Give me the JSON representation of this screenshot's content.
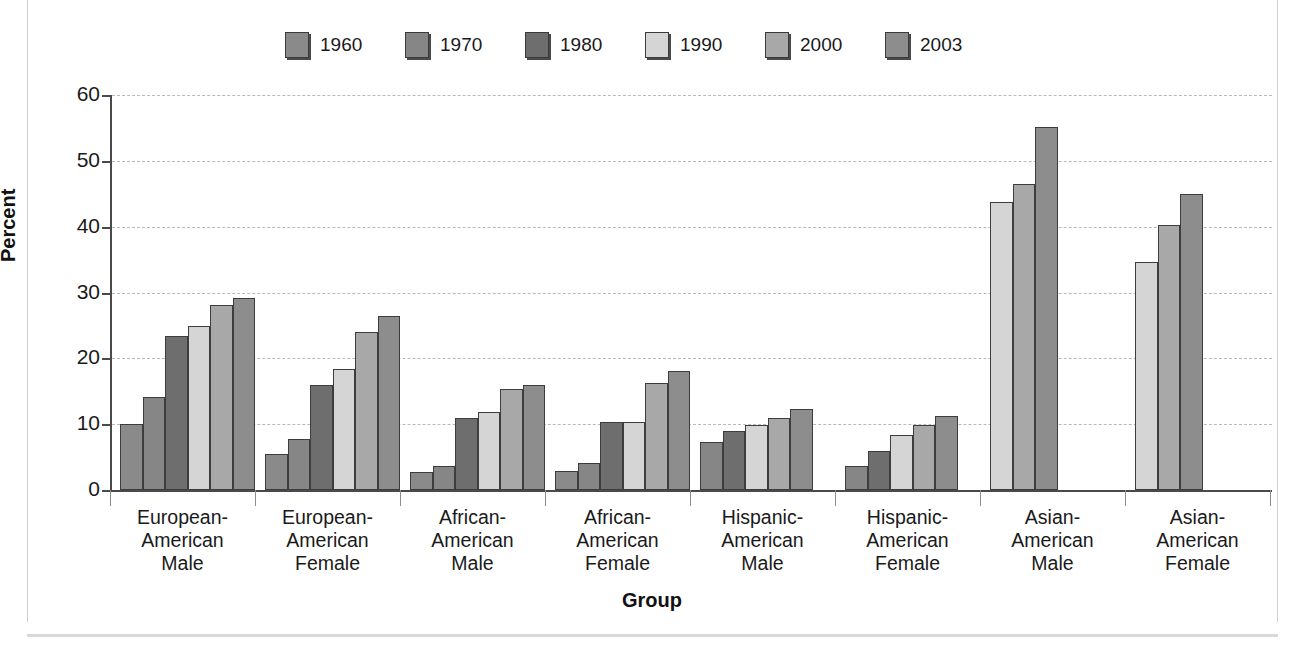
{
  "chart_data": {
    "type": "bar",
    "title": "",
    "xlabel": "Group",
    "ylabel": "Percent",
    "ylim": [
      0,
      60
    ],
    "yticks": [
      0,
      10,
      20,
      30,
      40,
      50,
      60
    ],
    "grid": true,
    "legend_position": "top",
    "categories": [
      "European-\nAmerican\nMale",
      "European-\nAmerican\nFemale",
      "African-\nAmerican\nMale",
      "African-\nAmerican\nFemale",
      "Hispanic-\nAmerican\nMale",
      "Hispanic-\nAmerican\nFemale",
      "Asian-\nAmerican\nMale",
      "Asian-\nAmerican\nFemale"
    ],
    "series": [
      {
        "name": "1960",
        "color": "#8a8a8a",
        "values": [
          10.0,
          5.5,
          2.7,
          2.9,
          null,
          null,
          null,
          null
        ]
      },
      {
        "name": "1970",
        "color": "#868686",
        "values": [
          14.2,
          7.8,
          3.6,
          4.1,
          7.3,
          3.7,
          null,
          null
        ]
      },
      {
        "name": "1980",
        "color": "#6e6e6e",
        "values": [
          23.4,
          15.9,
          10.9,
          10.3,
          8.9,
          5.9,
          null,
          null
        ]
      },
      {
        "name": "1990",
        "color": "#d5d5d5",
        "values": [
          24.9,
          18.4,
          11.8,
          10.3,
          9.8,
          8.3,
          43.8,
          34.7
        ]
      },
      {
        "name": "2000",
        "color": "#a8a8a8",
        "values": [
          28.1,
          24.0,
          15.4,
          16.2,
          11.0,
          9.9,
          46.5,
          40.3
        ]
      },
      {
        "name": "2003",
        "color": "#8d8d8d",
        "values": [
          29.2,
          26.4,
          16.0,
          18.1,
          12.3,
          11.3,
          55.2,
          44.9
        ]
      }
    ]
  },
  "axis": {
    "ytick_labels": [
      "0",
      "10",
      "20",
      "30",
      "40",
      "50",
      "60"
    ],
    "ylabel": "Percent",
    "xlabel": "Group"
  }
}
